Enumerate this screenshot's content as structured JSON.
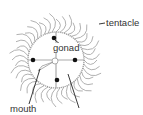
{
  "diagram": {
    "labels": {
      "tentacle": "tentacle",
      "gonad": "gonad",
      "mouth": "mouth"
    },
    "colors": {
      "outline": "#9a9a9a",
      "tentacle": "#a8a8a8",
      "dot": "#111111",
      "leader": "#222222",
      "text": "#333333"
    },
    "gonad_count": 4,
    "radial_canals": 4
  }
}
